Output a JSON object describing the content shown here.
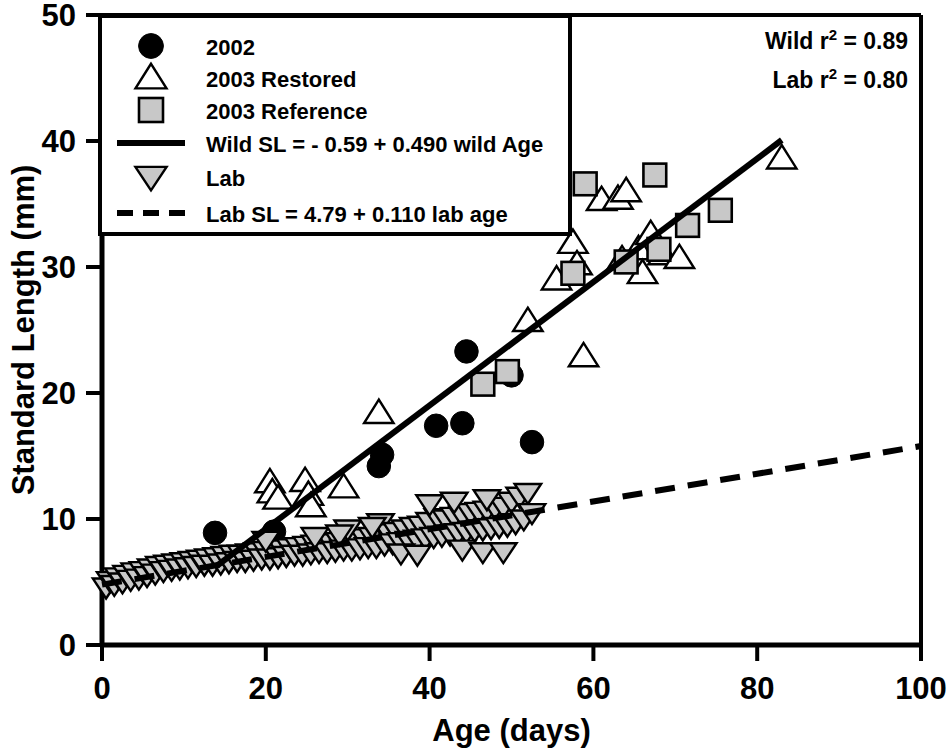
{
  "chart_data": {
    "type": "scatter",
    "title": "",
    "xlabel": "Age (days)",
    "ylabel": "Standard Length (mm)",
    "xlim": [
      0,
      100
    ],
    "ylim": [
      0,
      50
    ],
    "xticks": [
      0,
      20,
      40,
      60,
      80,
      100
    ],
    "yticks": [
      0,
      10,
      20,
      30,
      40,
      50
    ],
    "grid": false,
    "legend_position": "upper-left",
    "series": [
      {
        "name": "2002",
        "marker": "filled-circle",
        "color": "#000000",
        "points": [
          [
            13.8,
            8.9
          ],
          [
            21.0,
            9.0
          ],
          [
            33.8,
            14.2
          ],
          [
            34.2,
            15.1
          ],
          [
            40.8,
            17.4
          ],
          [
            44.0,
            17.6
          ],
          [
            44.5,
            23.3
          ],
          [
            50.0,
            21.4
          ],
          [
            52.5,
            16.1
          ]
        ]
      },
      {
        "name": "2003 Restored",
        "marker": "open-triangle-up",
        "color": "#000000",
        "points": [
          [
            20.5,
            12.9
          ],
          [
            20.8,
            12.1
          ],
          [
            21.5,
            11.6
          ],
          [
            24.8,
            13.0
          ],
          [
            25.2,
            11.9
          ],
          [
            25.5,
            11.0
          ],
          [
            29.5,
            12.5
          ],
          [
            33.8,
            18.4
          ],
          [
            52.0,
            25.7
          ],
          [
            55.5,
            29.0
          ],
          [
            57.5,
            31.9
          ],
          [
            58.0,
            30.2
          ],
          [
            61.0,
            35.3
          ],
          [
            63.0,
            35.4
          ],
          [
            63.5,
            30.6
          ],
          [
            64.0,
            36.0
          ],
          [
            65.5,
            31.4
          ],
          [
            66.0,
            29.5
          ],
          [
            67.0,
            32.6
          ],
          [
            68.5,
            31.0
          ],
          [
            70.5,
            30.7
          ],
          [
            58.8,
            22.9
          ],
          [
            83.0,
            38.6
          ]
        ]
      },
      {
        "name": "2003 Reference",
        "marker": "gray-square",
        "color": "#c8c8c8",
        "points": [
          [
            46.5,
            20.7
          ],
          [
            49.5,
            21.7
          ],
          [
            57.5,
            29.5
          ],
          [
            59.0,
            36.6
          ],
          [
            64.0,
            30.4
          ],
          [
            67.5,
            37.3
          ],
          [
            68.0,
            31.4
          ],
          [
            71.5,
            33.3
          ],
          [
            75.5,
            34.5
          ]
        ]
      },
      {
        "name": "Lab",
        "marker": "gray-triangle-down",
        "color": "#c8c8c8",
        "points": [
          [
            0.5,
            4.6
          ],
          [
            1.0,
            5.1
          ],
          [
            1.5,
            4.8
          ],
          [
            2.0,
            5.4
          ],
          [
            2.5,
            5.0
          ],
          [
            3.0,
            5.6
          ],
          [
            3.5,
            5.2
          ],
          [
            4.0,
            5.8
          ],
          [
            4.5,
            5.3
          ],
          [
            5.0,
            5.9
          ],
          [
            5.5,
            5.5
          ],
          [
            6.0,
            6.1
          ],
          [
            6.5,
            5.7
          ],
          [
            7.0,
            6.3
          ],
          [
            7.5,
            5.9
          ],
          [
            8.0,
            6.4
          ],
          [
            8.5,
            6.0
          ],
          [
            9.0,
            6.5
          ],
          [
            9.5,
            6.1
          ],
          [
            10.0,
            6.6
          ],
          [
            10.5,
            6.2
          ],
          [
            11.0,
            6.7
          ],
          [
            11.5,
            6.3
          ],
          [
            12.0,
            6.8
          ],
          [
            12.5,
            6.4
          ],
          [
            13.0,
            6.9
          ],
          [
            13.5,
            6.4
          ],
          [
            14.0,
            7.0
          ],
          [
            14.5,
            6.5
          ],
          [
            15.0,
            7.1
          ],
          [
            15.5,
            6.6
          ],
          [
            16.0,
            7.2
          ],
          [
            16.5,
            6.7
          ],
          [
            17.0,
            7.2
          ],
          [
            17.5,
            6.7
          ],
          [
            18.0,
            7.3
          ],
          [
            18.5,
            6.8
          ],
          [
            19.0,
            7.4
          ],
          [
            19.5,
            6.9
          ],
          [
            20.0,
            7.5
          ],
          [
            20.5,
            6.9
          ],
          [
            21.0,
            7.6
          ],
          [
            21.5,
            7.0
          ],
          [
            22.0,
            7.6
          ],
          [
            22.5,
            7.1
          ],
          [
            23.0,
            7.7
          ],
          [
            23.5,
            7.2
          ],
          [
            24.0,
            7.8
          ],
          [
            24.5,
            7.2
          ],
          [
            25.0,
            7.9
          ],
          [
            25.5,
            7.3
          ],
          [
            26.0,
            8.0
          ],
          [
            26.5,
            7.4
          ],
          [
            27.0,
            8.0
          ],
          [
            27.5,
            7.4
          ],
          [
            28.0,
            8.1
          ],
          [
            28.5,
            7.5
          ],
          [
            29.0,
            8.2
          ],
          [
            29.5,
            7.6
          ],
          [
            30.0,
            8.3
          ],
          [
            30.5,
            7.6
          ],
          [
            31.0,
            8.4
          ],
          [
            31.5,
            7.7
          ],
          [
            32.0,
            8.5
          ],
          [
            32.5,
            7.8
          ],
          [
            33.0,
            8.6
          ],
          [
            33.5,
            7.8
          ],
          [
            34.0,
            9.7
          ],
          [
            34.5,
            8.0
          ],
          [
            35.0,
            8.9
          ],
          [
            35.5,
            8.1
          ],
          [
            36.0,
            9.0
          ],
          [
            36.5,
            8.2
          ],
          [
            37.0,
            9.2
          ],
          [
            37.5,
            8.3
          ],
          [
            38.0,
            9.4
          ],
          [
            38.5,
            8.4
          ],
          [
            39.0,
            9.5
          ],
          [
            39.5,
            8.5
          ],
          [
            40.0,
            9.8
          ],
          [
            40.5,
            8.6
          ],
          [
            41.0,
            10.1
          ],
          [
            41.5,
            8.7
          ],
          [
            42.0,
            10.0
          ],
          [
            42.5,
            8.8
          ],
          [
            43.0,
            10.2
          ],
          [
            43.5,
            8.9
          ],
          [
            44.0,
            10.3
          ],
          [
            44.5,
            9.0
          ],
          [
            45.0,
            10.5
          ],
          [
            45.5,
            9.1
          ],
          [
            46.0,
            10.6
          ],
          [
            46.5,
            9.2
          ],
          [
            47.0,
            10.7
          ],
          [
            47.5,
            9.3
          ],
          [
            48.0,
            10.9
          ],
          [
            48.5,
            9.4
          ],
          [
            49.0,
            11.0
          ],
          [
            49.5,
            9.5
          ],
          [
            50.0,
            11.4
          ],
          [
            50.5,
            9.7
          ],
          [
            51.0,
            11.8
          ],
          [
            51.5,
            10.0
          ],
          [
            52.0,
            12.1
          ],
          [
            52.5,
            10.5
          ],
          [
            44.0,
            7.6
          ],
          [
            46.5,
            7.4
          ],
          [
            49.0,
            7.4
          ],
          [
            36.5,
            7.3
          ],
          [
            38.5,
            7.2
          ],
          [
            30.0,
            9.2
          ],
          [
            33.0,
            9.4
          ],
          [
            40.0,
            11.2
          ],
          [
            43.0,
            11.4
          ],
          [
            47.0,
            11.6
          ],
          [
            20.0,
            8.3
          ],
          [
            26.0,
            8.6
          ],
          [
            29.0,
            8.8
          ]
        ]
      }
    ],
    "fit_lines": [
      {
        "name": "Wild",
        "style": "solid",
        "intercept": -0.59,
        "slope": 0.49,
        "x_start": 14.0,
        "x_end": 83.0,
        "equation": "Wild SL = - 0.59 + 0.490 wild Age",
        "r_squared": "0.89"
      },
      {
        "name": "Lab",
        "style": "dashed",
        "intercept": 4.79,
        "slope": 0.11,
        "x_start": 0.0,
        "x_end": 100.0,
        "equation": "Lab SL = 4.79 + 0.110 lab age",
        "r_squared": "0.80"
      }
    ]
  },
  "axes": {
    "x_title": "Age (days)",
    "y_title": "Standard Length (mm)",
    "x_tick_labels": [
      "0",
      "20",
      "40",
      "60",
      "80",
      "100"
    ],
    "y_tick_labels": [
      "0",
      "10",
      "20",
      "30",
      "40",
      "50"
    ]
  },
  "legend": {
    "entries": [
      {
        "label": "2002",
        "marker": "filled-circle"
      },
      {
        "label": "2003 Restored",
        "marker": "open-triangle-up"
      },
      {
        "label": "2003 Reference",
        "marker": "gray-square"
      },
      {
        "label": "Wild SL = - 0.59 + 0.490 wild Age",
        "marker": "solid-line"
      },
      {
        "label": "Lab",
        "marker": "gray-triangle-down"
      },
      {
        "label": "Lab SL = 4.79 + 0.110 lab age",
        "marker": "dashed-line"
      }
    ]
  },
  "annotations": {
    "wild_r2_prefix": "Wild r",
    "wild_r2_sup": "2",
    "wild_r2_value": " = 0.89",
    "lab_r2_prefix": "Lab r",
    "lab_r2_sup": "2",
    "lab_r2_value": " = 0.80"
  },
  "colors": {
    "axis": "#000000",
    "marker_fill_gray": "#c8c8c8",
    "marker_fill_black": "#000000",
    "background": "#ffffff"
  }
}
